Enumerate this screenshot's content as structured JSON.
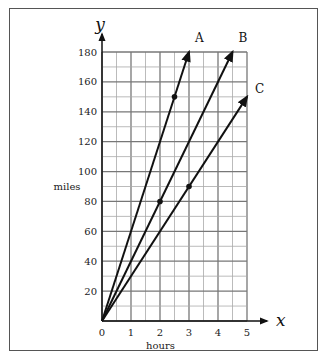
{
  "chart_data": {
    "type": "line",
    "title": "",
    "xlabel": "hours",
    "ylabel": "miles",
    "x_axis_symbol": "x",
    "y_axis_symbol": "y",
    "xlim": [
      0,
      5
    ],
    "ylim": [
      0,
      180
    ],
    "x_ticks": [
      "0",
      "1",
      "2",
      "3",
      "4",
      "5"
    ],
    "y_ticks": [
      "20",
      "40",
      "60",
      "80",
      "100",
      "120",
      "140",
      "160",
      "180"
    ],
    "grid": true,
    "series": [
      {
        "name": "A",
        "x": [
          0,
          2.5,
          3
        ],
        "y": [
          0,
          150,
          180
        ],
        "marked_point": [
          2.5,
          150
        ]
      },
      {
        "name": "B",
        "x": [
          0,
          2,
          4.5
        ],
        "y": [
          0,
          80,
          180
        ],
        "marked_point": [
          2,
          80
        ]
      },
      {
        "name": "C",
        "x": [
          0,
          3,
          5
        ],
        "y": [
          0,
          90,
          150
        ],
        "marked_point": [
          3,
          90
        ]
      }
    ]
  }
}
